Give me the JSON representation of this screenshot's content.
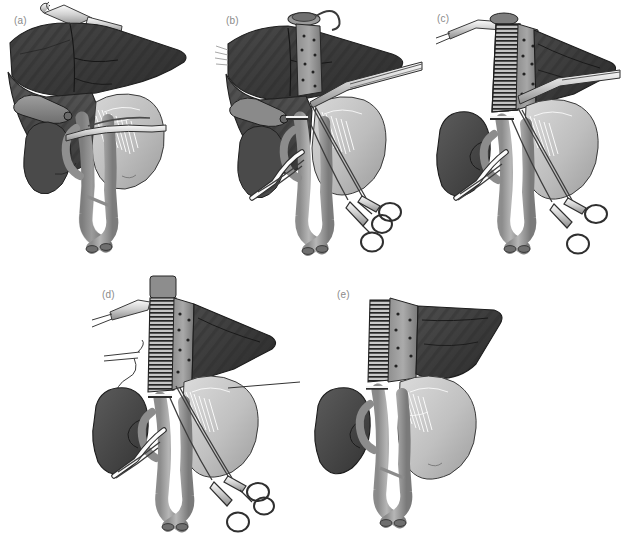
{
  "figure": {
    "background_color": "#ffffff",
    "width": 623,
    "height": 544,
    "label_color": "#8a8a8a",
    "style": "grayscale medical line-and-tone illustration",
    "panel_count": 5
  },
  "palette": {
    "liver_dark": "#3a3a3a",
    "liver_mid": "#4d4d4d",
    "liver_light": "#5e5e5e",
    "liver_stripe": "#2b2b2b",
    "kidney_dark": "#454545",
    "kidney_mid": "#565656",
    "stomach_light": "#c8c8c8",
    "stomach_mid": "#b2b2b2",
    "stomach_shadow": "#9a9a9a",
    "vessel_mid": "#9b9b9b",
    "vessel_dark": "#7d7d7d",
    "vessel_light": "#bdbdbd",
    "graft_gray": "#a0a0a0",
    "graft_rib": "#2e2e2e",
    "instrument_fill": "#e8e8e8",
    "instrument_stroke": "#3d3d3d",
    "outline": "#2a2a2a",
    "suture_white": "#ffffff",
    "speckle": "#2d2d2d",
    "background": "#ffffff"
  },
  "panels": [
    {
      "id": "a",
      "label": "(a)",
      "label_x": 14,
      "label_y": 22,
      "x": 0,
      "y": 0,
      "width": 210,
      "height": 262,
      "caption": "Native anatomy with liver retracted; vascular clamp applied across the hepatic hilum",
      "structures": [
        "liver",
        "gallbladder",
        "stomach",
        "kidney",
        "duodenum",
        "aorta",
        "inferior vena cava",
        "iliac bifurcation",
        "splenic vessels"
      ],
      "instruments": [
        "retractor",
        "vascular-clamp"
      ],
      "graft_present": false
    },
    {
      "id": "b",
      "label": "(b)",
      "label_x": 226,
      "label_y": 22,
      "x": 212,
      "y": 0,
      "width": 222,
      "height": 262,
      "caption": "Suprahepatic cuff secured; cannulae inserted and hemostats placed on vascular tapes",
      "structures": [
        "liver",
        "gallbladder",
        "stomach",
        "kidney",
        "aorta",
        "inferior vena cava",
        "cannula"
      ],
      "instruments": [
        "retractor",
        "suction-cannula",
        "hemostat",
        "hemostat"
      ],
      "graft_present": false
    },
    {
      "id": "c",
      "label": "(c)",
      "label_x": 437,
      "label_y": 20,
      "x": 434,
      "y": 0,
      "width": 189,
      "height": 262,
      "caption": "Ribbed vascular conduit anastomosed to the supra-hepatic vena cava; liver mobilised",
      "structures": [
        "liver",
        "stomach",
        "kidney",
        "aorta",
        "inferior vena cava",
        "vascular-graft"
      ],
      "instruments": [
        "retractor",
        "suction-cannula",
        "hemostat",
        "hemostat"
      ],
      "graft_present": true
    },
    {
      "id": "d",
      "label": "(d)",
      "label_x": 102,
      "label_y": 297,
      "x": 88,
      "y": 272,
      "width": 226,
      "height": 272,
      "caption": "Graft in position with additional cannula; traction sutures on stomach and hilar plate",
      "structures": [
        "liver",
        "stomach",
        "kidney",
        "aorta",
        "inferior vena cava",
        "vascular-graft"
      ],
      "instruments": [
        "retractor",
        "suction-cannula",
        "probe",
        "hemostat",
        "hemostat"
      ],
      "graft_present": true
    },
    {
      "id": "e",
      "label": "(e)",
      "label_x": 337,
      "label_y": 297,
      "x": 326,
      "y": 272,
      "width": 240,
      "height": 272,
      "caption": "Completed reconstruction: instruments removed, conduit perfusing the remnant liver",
      "structures": [
        "liver",
        "stomach",
        "kidney",
        "aorta",
        "inferior vena cava",
        "iliac bifurcation",
        "vascular-graft"
      ],
      "instruments": [],
      "graft_present": true
    }
  ]
}
